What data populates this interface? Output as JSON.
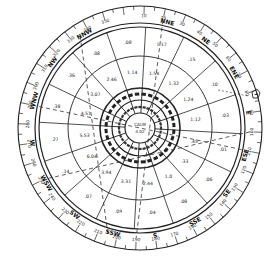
{
  "chart_data": {
    "type": "polar-wind-rose",
    "title": "",
    "center_label": "CALM",
    "center_value": "4.02",
    "directions": [
      "N",
      "NNE",
      "NE",
      "ENE",
      "E",
      "ESE",
      "SE",
      "SSE",
      "S",
      "SSW",
      "SW",
      "WSW",
      "W",
      "WNW",
      "NW",
      "NNW"
    ],
    "visible_direction_labels": [
      "NNE",
      "NE",
      "ENE",
      "E",
      "ESE",
      "SE",
      "SSE",
      "S",
      "SSW",
      "SW",
      "WSW",
      "W",
      "WNW",
      "NW",
      "NNW"
    ],
    "degree_ticks": [
      10,
      20,
      30,
      40,
      50,
      60,
      70,
      80,
      90,
      100,
      110,
      120,
      130,
      140,
      150,
      160,
      170,
      180,
      190,
      200,
      210,
      220,
      230,
      240,
      250,
      260,
      270,
      280,
      290,
      300,
      310,
      320,
      330,
      340,
      350
    ],
    "rings": [
      "inner",
      "middle",
      "outer"
    ],
    "sector_values": [
      {
        "direction": "N",
        "middle": "1.14",
        "outer": ".08"
      },
      {
        "direction": "NNE",
        "middle": "1.54",
        "outer": "1.17"
      },
      {
        "direction": "NE",
        "middle": "1.32",
        "outer": ".15"
      },
      {
        "direction": "ENE",
        "middle": "1.24",
        "outer": ".10"
      },
      {
        "direction": "E",
        "middle": "1.12",
        "outer": ".03"
      },
      {
        "direction": "ESE",
        "middle": ".45",
        "outer": ".01"
      },
      {
        "direction": "SE",
        "middle": ".33",
        "outer": ".06"
      },
      {
        "direction": "SSE",
        "middle": "1.0",
        "outer": ".08"
      },
      {
        "direction": "S",
        "middle": "2.44",
        "outer": ".04"
      },
      {
        "direction": "SSW",
        "middle": "3.31",
        "outer": ".09"
      },
      {
        "direction": "SW",
        "middle": "3.94",
        "outer": ".07"
      },
      {
        "direction": "WSW",
        "middle": "6.04",
        "outer": ".14"
      },
      {
        "direction": "W",
        "middle": "5.53",
        "outer": ".27"
      },
      {
        "direction": "WNW",
        "middle": "4.51",
        "outer": ".38"
      },
      {
        "direction": "NW",
        "middle": "3.07",
        "outer": ".36"
      },
      {
        "direction": "NNW",
        "middle": "2.46",
        "outer": ".08"
      }
    ],
    "annotations": [
      "NORTH (dashed reference)",
      "wind direction arrow (upper right)"
    ]
  },
  "labels": {
    "calm": "CALM",
    "calm_value": "4.02"
  }
}
